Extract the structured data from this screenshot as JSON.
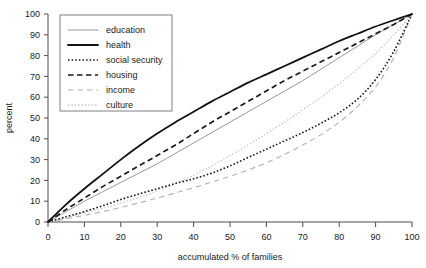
{
  "chart_data": {
    "type": "line",
    "title": "",
    "xlabel": "accumulated % of families",
    "ylabel": "percent",
    "xlim": [
      0,
      100
    ],
    "ylim": [
      0,
      100
    ],
    "xticks": [
      0,
      10,
      20,
      30,
      40,
      50,
      60,
      70,
      80,
      90,
      100
    ],
    "yticks": [
      0,
      10,
      20,
      30,
      40,
      50,
      60,
      70,
      80,
      90,
      100
    ],
    "grid": false,
    "legend_position": "top-left",
    "x": [
      0,
      5,
      10,
      15,
      20,
      25,
      30,
      35,
      40,
      45,
      50,
      55,
      60,
      65,
      70,
      75,
      80,
      85,
      90,
      95,
      100
    ],
    "series": [
      {
        "name": "education",
        "style": "solid-thin-gray",
        "color": "#999999",
        "values": [
          0,
          5,
          10,
          14.5,
          19,
          23.5,
          28,
          33,
          38,
          43,
          48,
          53,
          58,
          63,
          68,
          73.5,
          79,
          84.5,
          90,
          95,
          100
        ]
      },
      {
        "name": "health",
        "style": "solid-thick-black",
        "color": "#111111",
        "values": [
          0,
          8.5,
          16,
          23,
          30,
          36.5,
          42.5,
          48,
          53,
          58,
          62.5,
          67,
          71,
          75,
          79,
          83,
          87,
          90.5,
          94,
          97,
          100
        ]
      },
      {
        "name": "social security",
        "style": "dotted-black",
        "color": "#1a1a1a",
        "values": [
          0,
          2.5,
          5,
          7.8,
          10.8,
          13.5,
          16,
          18.5,
          20.8,
          23.5,
          27,
          31,
          35,
          39,
          43,
          47.5,
          52.5,
          59,
          68.5,
          82,
          100
        ]
      },
      {
        "name": "housing",
        "style": "dashed-black",
        "color": "#1a1a1a",
        "values": [
          0,
          6,
          11.5,
          17,
          22,
          27,
          32,
          37,
          42.5,
          48,
          53,
          58,
          63,
          68,
          72.5,
          77,
          81.5,
          86,
          90.5,
          95,
          100
        ]
      },
      {
        "name": "income",
        "style": "dashed-gray",
        "color": "#b0b0b0",
        "values": [
          0,
          1.5,
          3.2,
          5,
          7,
          9.2,
          11.5,
          14,
          16.5,
          19.2,
          22,
          25,
          28.5,
          32.5,
          37,
          42,
          48,
          55.5,
          65,
          79,
          100
        ]
      },
      {
        "name": "culture",
        "style": "dotted-gray",
        "color": "#c4c4c4",
        "values": [
          0,
          2,
          4.3,
          6.6,
          9,
          11.8,
          15,
          18.5,
          22.5,
          27,
          32,
          37,
          42.5,
          48,
          54,
          60,
          66.5,
          73.5,
          81,
          90,
          100
        ]
      }
    ]
  },
  "legend": {
    "items": [
      {
        "label": "education"
      },
      {
        "label": "health"
      },
      {
        "label": "social security"
      },
      {
        "label": "housing"
      },
      {
        "label": "income"
      },
      {
        "label": "culture"
      }
    ]
  },
  "axes": {
    "x_title": "accumulated % of families",
    "y_title": "percent",
    "x_tick_labels": [
      "0",
      "10",
      "20",
      "30",
      "40",
      "50",
      "60",
      "70",
      "80",
      "90",
      "100"
    ],
    "y_tick_labels": [
      "0",
      "10",
      "20",
      "30",
      "40",
      "50",
      "60",
      "70",
      "80",
      "90",
      "100"
    ]
  }
}
